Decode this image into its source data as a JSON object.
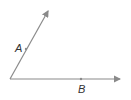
{
  "diagram": {
    "type": "angle",
    "vertex": {
      "x": 10,
      "y": 79
    },
    "rays": [
      {
        "name": "ray-A",
        "end": {
          "x": 49,
          "y": 10
        }
      },
      {
        "name": "ray-B",
        "end": {
          "x": 121,
          "y": 79
        }
      }
    ],
    "points": [
      {
        "label": "A",
        "x": 26,
        "y": 49
      },
      {
        "label": "B",
        "x": 81,
        "y": 79
      }
    ],
    "colors": {
      "line": "#8a8a8a",
      "label": "#333333"
    }
  }
}
